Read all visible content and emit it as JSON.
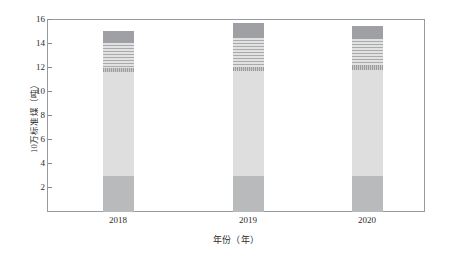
{
  "chart_data": {
    "type": "bar",
    "subtype": "stacked-bar",
    "title": "",
    "xlabel": "年份（年）",
    "ylabel": "10万标准煤（吨）",
    "categories": [
      "2018",
      "2019",
      "2020"
    ],
    "xtick_labels": [
      "2018",
      "2019",
      "2020"
    ],
    "ytick_labels": [
      "2",
      "4",
      "6",
      "8",
      "10",
      "12",
      "14",
      "16"
    ],
    "ylim": [
      0,
      16
    ],
    "ytick_step": 2,
    "grid": false,
    "legend": "none",
    "series": [
      {
        "name": "segment-1-base",
        "order": 1,
        "fill": "#b9babc",
        "pattern": "solid",
        "values": [
          3.0,
          3.0,
          3.0
        ]
      },
      {
        "name": "segment-2-light",
        "order": 2,
        "fill": "#dededf",
        "pattern": "solid",
        "values": [
          8.6,
          8.7,
          8.8
        ]
      },
      {
        "name": "segment-3-dotted",
        "order": 3,
        "fill": "#cccccd",
        "pattern": "dotted",
        "values": [
          0.35,
          0.35,
          0.35
        ]
      },
      {
        "name": "segment-4-striped",
        "order": 4,
        "fill": "#e2e2e3",
        "pattern": "horizontal-stripes",
        "values": [
          2.1,
          2.4,
          2.2
        ]
      },
      {
        "name": "segment-5-dark-cap",
        "order": 5,
        "fill": "#9fa0a3",
        "pattern": "solid",
        "values": [
          0.95,
          1.25,
          1.05
        ]
      }
    ],
    "totals": [
      15.0,
      15.7,
      15.4
    ],
    "bar_width_px": 31
  },
  "axis": {
    "y_title": "10万标准煤（吨）",
    "x_title": "年份（年）"
  }
}
